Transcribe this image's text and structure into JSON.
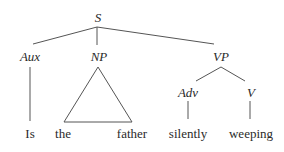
{
  "diagram": {
    "type": "syntax-tree",
    "nodes": {
      "S": {
        "label": "S"
      },
      "Aux": {
        "label": "Aux"
      },
      "NP": {
        "label": "NP"
      },
      "VP": {
        "label": "VP"
      },
      "Adv": {
        "label": "Adv"
      },
      "V": {
        "label": "V"
      }
    },
    "leaves": {
      "is": "Is",
      "the": "the",
      "father": "father",
      "silently": "silently",
      "weeping": "weeping"
    },
    "edges": [
      [
        "S",
        "Aux"
      ],
      [
        "S",
        "NP"
      ],
      [
        "S",
        "VP"
      ],
      [
        "Aux",
        "Is"
      ],
      [
        "NP",
        "the father (triangle)"
      ],
      [
        "VP",
        "Adv"
      ],
      [
        "VP",
        "V"
      ],
      [
        "Adv",
        "silently"
      ],
      [
        "V",
        "weeping"
      ]
    ],
    "colors": {
      "text": "#2a2a2a",
      "line": "#555555",
      "background": "#ffffff"
    }
  }
}
